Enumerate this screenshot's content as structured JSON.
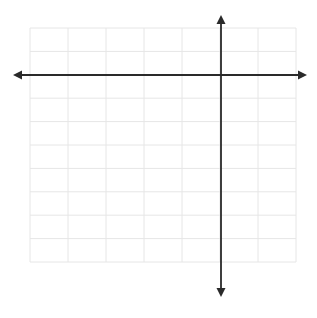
{
  "diagram": {
    "type": "coordinate-plane",
    "grid": {
      "x0": 30,
      "y0": 28,
      "cols": 7,
      "rows": 10,
      "cell_w": 38,
      "cell_h": 23.4,
      "color": "#e6e6e6"
    },
    "x_axis": {
      "y": 75,
      "x_start": 13,
      "x_end": 307,
      "color": "#2a2a2a"
    },
    "y_axis": {
      "x": 221,
      "y_start": 15,
      "y_end": 297,
      "color": "#2a2a2a"
    },
    "background": "#ffffff"
  }
}
